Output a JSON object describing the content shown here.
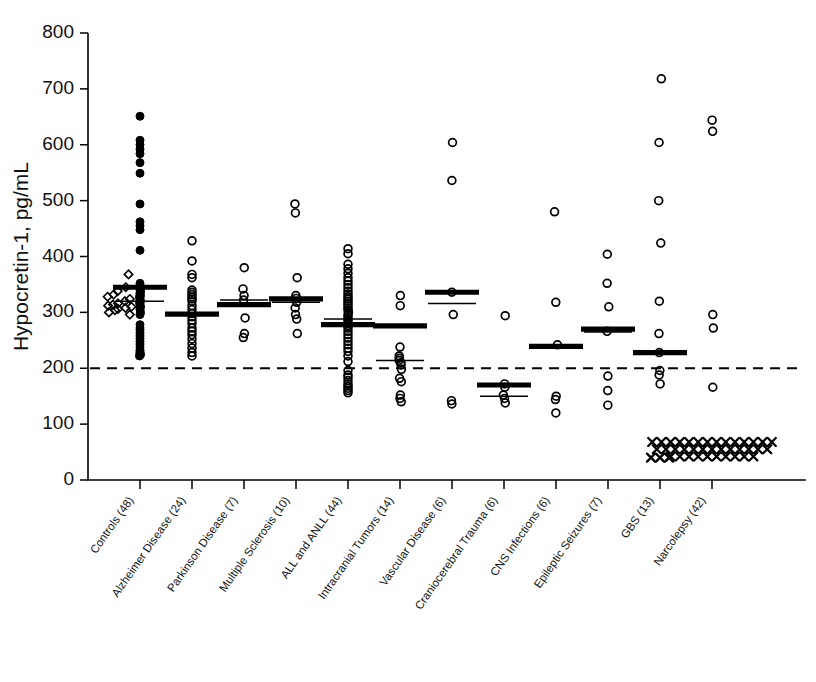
{
  "chart_data": {
    "type": "scatter",
    "title": "",
    "xlabel": "",
    "ylabel": "Hypocretin-1, pg/mL",
    "ylim": [
      0,
      800
    ],
    "yticks": [
      0,
      100,
      200,
      300,
      400,
      500,
      600,
      700,
      800
    ],
    "grid": false,
    "legend_position": "none",
    "annotations": [
      {
        "name": "cutoff-line",
        "value": 200,
        "style": "dashed-horizontal",
        "label": ""
      }
    ],
    "categories": [
      "Controls (48)",
      "Alzheimer Disease (24)",
      "Parkinson Disease (7)",
      "Multiple Sclerosis (10)",
      "ALL and ANLL (44)",
      "Intracranial Tumors (14)",
      "Vascular Disease (6)",
      "Craniocerebral Trauma (6)",
      "CNS Infections (6)",
      "Epileptic Seizures (7)",
      "GBS (13)",
      "Narcolepsy (42)"
    ],
    "groups": [
      {
        "name": "Controls (48)",
        "n": 48,
        "marker": "filled-circle",
        "mean": 345,
        "median": 320,
        "values": [
          651,
          608,
          600,
          592,
          584,
          568,
          549,
          494,
          462,
          455,
          448,
          411,
          352,
          348,
          345,
          343,
          340,
          338,
          335,
          333,
          330,
          328,
          325,
          322,
          320,
          318,
          315,
          312,
          310,
          308,
          305,
          300,
          296,
          278,
          272,
          268,
          263,
          258,
          253,
          248,
          243,
          238,
          233,
          230,
          228,
          226,
          224,
          222
        ],
        "extra_marker": "diamond",
        "extra_values": [
          368,
          345,
          338,
          332,
          328,
          324,
          320,
          316,
          314,
          312,
          310,
          308,
          306,
          304,
          300,
          296
        ]
      },
      {
        "name": "Alzheimer Disease (24)",
        "n": 24,
        "marker": "open-circle",
        "mean": 297,
        "median": 297,
        "values": [
          428,
          392,
          368,
          362,
          340,
          336,
          332,
          328,
          324,
          320,
          312,
          305,
          298,
          292,
          286,
          280,
          272,
          266,
          260,
          252,
          244,
          236,
          228,
          222
        ]
      },
      {
        "name": "Parkinson Disease (7)",
        "n": 7,
        "marker": "open-circle",
        "mean": 314,
        "median": 322,
        "values": [
          380,
          342,
          330,
          322,
          290,
          262,
          255
        ]
      },
      {
        "name": "Multiple Sclerosis (10)",
        "n": 10,
        "marker": "open-circle",
        "mean": 324,
        "median": 318,
        "values": [
          494,
          478,
          362,
          330,
          325,
          318,
          308,
          296,
          288,
          262
        ]
      },
      {
        "name": "ALL and ANLL (44)",
        "n": 44,
        "marker": "open-circle",
        "mean": 278,
        "median": 288,
        "values": [
          414,
          405,
          386,
          378,
          370,
          362,
          356,
          350,
          344,
          338,
          333,
          328,
          324,
          320,
          316,
          312,
          308,
          304,
          300,
          296,
          292,
          288,
          284,
          280,
          276,
          272,
          266,
          260,
          254,
          248,
          242,
          236,
          230,
          222,
          212,
          196,
          188,
          184,
          178,
          172,
          168,
          164,
          160,
          156
        ]
      },
      {
        "name": "Intracranial Tumors (14)",
        "n": 14,
        "marker": "open-circle",
        "mean": 276,
        "median": 214,
        "values": [
          330,
          312,
          238,
          222,
          218,
          214,
          210,
          206,
          198,
          182,
          176,
          152,
          146,
          140
        ]
      },
      {
        "name": "Vascular Disease (6)",
        "n": 6,
        "marker": "open-circle",
        "mean": 336,
        "median": 316,
        "values": [
          604,
          536,
          336,
          296,
          142,
          136
        ]
      },
      {
        "name": "Craniocerebral Trauma (6)",
        "n": 6,
        "marker": "open-circle",
        "mean": 170,
        "median": 150,
        "values": [
          294,
          172,
          166,
          152,
          146,
          138
        ]
      },
      {
        "name": "CNS Infections (6)",
        "n": 6,
        "marker": "open-circle",
        "mean": 239,
        "median": 239,
        "values": [
          480,
          318,
          242,
          150,
          144,
          120
        ]
      },
      {
        "name": "Epileptic Seizures (7)",
        "n": 7,
        "marker": "open-circle",
        "mean": 270,
        "median": 265,
        "values": [
          404,
          352,
          310,
          266,
          186,
          160,
          134
        ]
      },
      {
        "name": "GBS (13)",
        "n": 13,
        "marker": "open-circle",
        "mean": 228,
        "median": 228,
        "values": [
          718,
          604,
          500,
          424,
          320,
          262,
          228,
          196,
          188,
          172
        ],
        "extra_marker": "x",
        "extra_values": [
          40,
          40,
          40
        ]
      },
      {
        "name": "Narcolepsy (42)",
        "n": 42,
        "marker": "open-circle",
        "mean": null,
        "median": null,
        "values": [
          644,
          624,
          296,
          272,
          166
        ],
        "extra_marker": "x",
        "extra_values": [
          68,
          68,
          68,
          68,
          68,
          68,
          68,
          68,
          68,
          68,
          68,
          68,
          68,
          68,
          55,
          55,
          55,
          55,
          55,
          55,
          55,
          55,
          55,
          55,
          55,
          55,
          55,
          42,
          42,
          42,
          42,
          42,
          42,
          42,
          42,
          42,
          42
        ]
      }
    ]
  },
  "axis": {
    "y_label": "Hypocretin-1, pg/mL",
    "y_tick_labels": [
      "0",
      "100",
      "200",
      "300",
      "400",
      "500",
      "600",
      "700",
      "800"
    ]
  }
}
